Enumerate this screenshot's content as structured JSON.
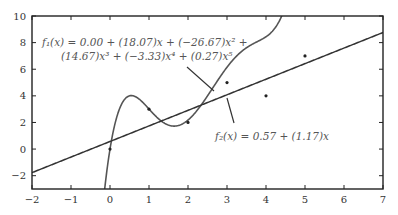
{
  "chart_data": {
    "type": "line",
    "title": "",
    "xlabel": "",
    "ylabel": "",
    "xlim": [
      -2,
      7
    ],
    "ylim": [
      -3,
      10
    ],
    "grid": false,
    "x_ticks": [
      -2,
      -1,
      0,
      1,
      2,
      3,
      4,
      5,
      6,
      7
    ],
    "x_tick_labels": [
      "−2",
      "−1",
      "0",
      "1",
      "2",
      "3",
      "4",
      "5",
      "6",
      "7"
    ],
    "y_ticks": [
      -2,
      0,
      2,
      4,
      6,
      8,
      10
    ],
    "y_tick_labels": [
      "−2",
      "0",
      "2",
      "4",
      "6",
      "8",
      "10"
    ],
    "points": {
      "x": [
        0,
        1,
        2,
        3,
        4,
        5
      ],
      "y": [
        0,
        3,
        2,
        5,
        4,
        7
      ]
    },
    "series": [
      {
        "name": "f1",
        "kind": "polynomial",
        "coefficients": [
          0.0,
          18.07,
          -26.67,
          14.67,
          -3.33,
          0.27
        ],
        "label_line1": "f₁(x) = 0.00 + (18.07)x + (−26.67)x² +",
        "label_line2": "(14.67)x³ + (−3.33)x⁴ + (0.27)x⁵",
        "color": "#555555"
      },
      {
        "name": "f2",
        "kind": "polynomial",
        "coefficients": [
          0.57,
          1.17
        ],
        "label_line1": "f₂(x) = 0.57 + (1.17)x",
        "color": "#333333"
      }
    ]
  }
}
